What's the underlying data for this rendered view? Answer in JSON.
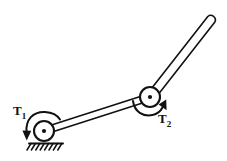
{
  "diagram": {
    "background_color": "#ffffff",
    "stroke_color": "#111111",
    "labels": {
      "torque_1": {
        "symbol": "T",
        "subscript": "1",
        "text": "T1"
      },
      "torque_2": {
        "symbol": "T",
        "subscript": "2",
        "text": "T2"
      }
    },
    "joints": [
      {
        "name": "grounded-pivot",
        "cx": 44,
        "cy": 131,
        "r": 10,
        "hub_r": 2.1,
        "fixed": true
      },
      {
        "name": "intermediate-joint",
        "cx": 150,
        "cy": 97,
        "r": 10,
        "hub_r": 2.1,
        "fixed": false
      }
    ],
    "links": [
      {
        "name": "lower-link",
        "from": [
          44,
          131
        ],
        "to": [
          150,
          97
        ],
        "width": 7
      },
      {
        "name": "upper-link",
        "from": [
          150,
          97
        ],
        "to": [
          211,
          19
        ],
        "width": 8
      }
    ],
    "ground": {
      "name": "ground-support",
      "x1": 29,
      "x2": 63,
      "y": 143,
      "hatch_count": 8
    },
    "torque_arrows": [
      {
        "name": "torque-arrow-1",
        "attached_to": "grounded-pivot",
        "direction": "counterclockwise",
        "label": "T1"
      },
      {
        "name": "torque-arrow-2",
        "attached_to": "intermediate-joint",
        "direction": "counterclockwise",
        "label": "T2"
      }
    ]
  }
}
